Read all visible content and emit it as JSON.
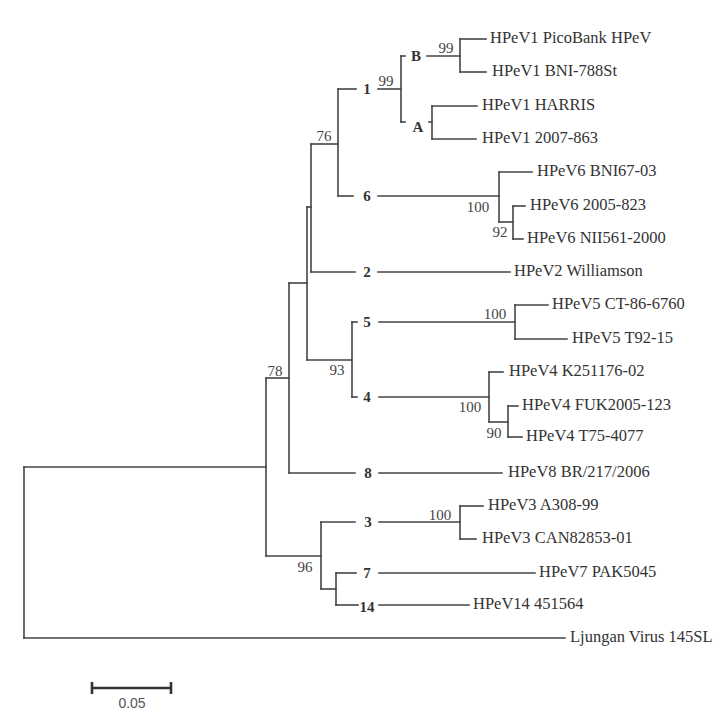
{
  "tree": {
    "type": "phylogenetic_tree",
    "layout": "rectangular, rooted on outgroup",
    "leaves": [
      {
        "label": "HPeV1 PicoBank HPeV",
        "clade": "1",
        "subclade": "B"
      },
      {
        "label": "HPeV1 BNI-788St",
        "clade": "1",
        "subclade": "B"
      },
      {
        "label": "HPeV1 HARRIS",
        "clade": "1",
        "subclade": "A"
      },
      {
        "label": "HPeV1 2007-863",
        "clade": "1",
        "subclade": "A"
      },
      {
        "label": "HPeV6 BNI67-03",
        "clade": "6"
      },
      {
        "label": "HPeV6 2005-823",
        "clade": "6"
      },
      {
        "label": "HPeV6 NII561-2000",
        "clade": "6"
      },
      {
        "label": "HPeV2 Williamson",
        "clade": "2"
      },
      {
        "label": "HPeV5 CT-86-6760",
        "clade": "5"
      },
      {
        "label": "HPeV5 T92-15",
        "clade": "5"
      },
      {
        "label": "HPeV4 K251176-02",
        "clade": "4"
      },
      {
        "label": "HPeV4 FUK2005-123",
        "clade": "4"
      },
      {
        "label": "HPeV4 T75-4077",
        "clade": "4"
      },
      {
        "label": "HPeV8 BR/217/2006",
        "clade": "8"
      },
      {
        "label": "HPeV3 A308-99",
        "clade": "3"
      },
      {
        "label": "HPeV3 CAN82853-01",
        "clade": "3"
      },
      {
        "label": "HPeV7 PAK5045",
        "clade": "7"
      },
      {
        "label": "HPeV14 451564",
        "clade": "14"
      },
      {
        "label": "Ljungan Virus 145SL",
        "clade": "outgroup"
      }
    ],
    "clades": [
      {
        "label": "1"
      },
      {
        "label": "B"
      },
      {
        "label": "A"
      },
      {
        "label": "6"
      },
      {
        "label": "2"
      },
      {
        "label": "5"
      },
      {
        "label": "4"
      },
      {
        "label": "8"
      },
      {
        "label": "3"
      },
      {
        "label": "7"
      },
      {
        "label": "14"
      }
    ],
    "bootstrap": [
      {
        "value": "99",
        "node": "subclade B (PicoBank HPeV + BNI-788St)"
      },
      {
        "value": "99",
        "node": "genotype 1 (subclades A + B)"
      },
      {
        "value": "76",
        "node": "genotypes 1 + 6"
      },
      {
        "value": "100",
        "node": "genotype 6"
      },
      {
        "value": "92",
        "node": "HPeV6 2005-823 + NII561-2000"
      },
      {
        "value": "100",
        "node": "genotype 5"
      },
      {
        "value": "93",
        "node": "genotypes 5 + 4"
      },
      {
        "value": "100",
        "node": "genotype 4"
      },
      {
        "value": "90",
        "node": "HPeV4 FUK2005-123 + T75-4077"
      },
      {
        "value": "78",
        "node": "genotypes 1,6,2,5,4 + 8"
      },
      {
        "value": "100",
        "node": "genotype 3"
      },
      {
        "value": "96",
        "node": "genotypes 3 + 7 + 14"
      }
    ],
    "scale_bar": {
      "label": "0.05",
      "length": 0.05
    },
    "newick": "(((((((('HPeV1 PicoBank HPeV':0.016,'HPeV1 BNI-788St':0.016)99:0.037,('HPeV1 HARRIS':0.029,'HPeV1 2007-863':0.028):0.020)99:0.040,('HPeV6 BNI67-03':0.021,('HPeV6 2005-823':0.008,'HPeV6 NII561-2000':0.006)92:0.009)100:0.102)76:0.017,'HPeV2 Williamson':0.126):0.003,(('HPeV5 CT-86-6760':0.021,'HPeV5 T92-15':0.033)100:0.103,('HPeV4 K251176-02':0.009,('HPeV4 FUK2005-123':0.006,'HPeV4 T75-4077':0.009)90:0.012)100:0.087)93:0.028):0.011,'HPeV8 BR/217/2006':0.135)78:0.015,(('HPeV3 A308-99':0.013,'HPeV3 CAN82853-01':0.011)100:0.088,('HPeV7 PAK5045':0.126,'HPeV14 451564':0.085):0.009)96:0.035):0.153,'Ljungan Virus 145SL':0.342);"
  }
}
